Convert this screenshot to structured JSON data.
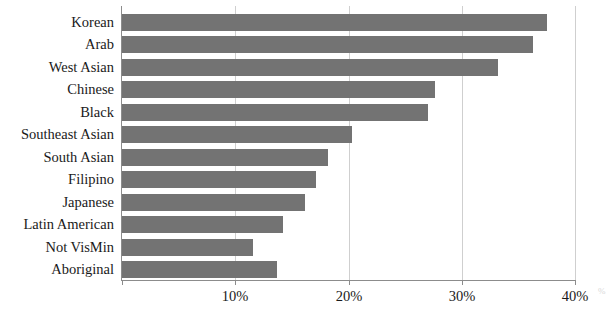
{
  "chart_data": {
    "type": "bar",
    "orientation": "horizontal",
    "title": "",
    "subtitle": "",
    "xlabel": "",
    "ylabel": "",
    "xlim": [
      0,
      40
    ],
    "xticks": [
      0,
      10,
      20,
      30,
      40
    ],
    "xtick_labels": [
      "",
      "10%",
      "20%",
      "30%",
      "40%"
    ],
    "grid": "vertical",
    "legend": "none",
    "bar_color": "#737373",
    "axis_color": "#8c8c8c",
    "gridline_color": "#cfcfcf",
    "text_color": "#1a1a1a",
    "categories": [
      "Korean",
      "Arab",
      "West Asian",
      "Chinese",
      "Black",
      "Southeast Asian",
      "South Asian",
      "Filipino",
      "Japanese",
      "Latin American",
      "Not VisMin",
      "Aboriginal"
    ],
    "values": [
      37.5,
      36.3,
      33.2,
      27.6,
      27.0,
      20.3,
      18.2,
      17.1,
      16.2,
      14.2,
      11.6,
      13.7
    ],
    "units": "percent"
  }
}
